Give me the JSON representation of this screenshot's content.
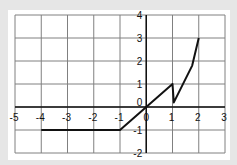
{
  "chart_data": {
    "type": "line",
    "title": "",
    "xlabel": "",
    "ylabel": "",
    "xlim": [
      -5,
      3
    ],
    "ylim": [
      -2,
      4
    ],
    "grid": true,
    "legend": null,
    "x_ticks": [
      -5,
      -4,
      -3,
      -2,
      -1,
      0,
      1,
      2,
      3
    ],
    "y_ticks": [
      -2,
      -1,
      0,
      1,
      2,
      3,
      4
    ],
    "x_tick_labels": [
      "-5",
      "-4",
      "-3",
      "-2",
      "-1",
      "0",
      "1",
      "2",
      "3"
    ],
    "y_tick_labels": [
      "-2",
      "-1",
      "0",
      "1",
      "2",
      "3",
      "4"
    ],
    "series": [
      {
        "name": "piecewise function",
        "x": [
          -4,
          -1,
          0,
          1,
          1.05,
          1.75,
          2
        ],
        "y": [
          -1,
          -1,
          0,
          1,
          0.2,
          1.8,
          3
        ]
      }
    ]
  },
  "colors": {
    "background": "#e6e6e6",
    "plot_area": "#ffffff",
    "grid": "#808080",
    "axis": "#111111",
    "line": "#111111"
  }
}
